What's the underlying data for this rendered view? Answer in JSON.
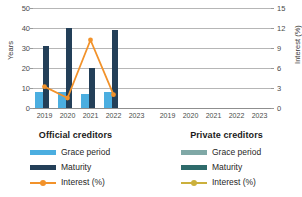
{
  "chart_data": {
    "type": "bar",
    "title": "",
    "subtitle": "",
    "categories": [
      "2019",
      "2020",
      "2021",
      "2022",
      "2023"
    ],
    "xlabel": "",
    "ylabel": "Years",
    "ylabel_secondary": "Interest (%)",
    "ylim": [
      0,
      50
    ],
    "ylim_secondary": [
      0,
      15
    ],
    "yticks": [
      "0",
      "10",
      "20",
      "30",
      "40",
      "50"
    ],
    "yticks_secondary": [
      "0",
      "3",
      "6",
      "9",
      "12",
      "15"
    ],
    "grid": true,
    "legend_position": "bottom",
    "panels": [
      {
        "name": "official",
        "title": "Official creditors",
        "series": [
          {
            "name": "Grace period",
            "type": "bar",
            "axis": "left",
            "color": "#4BAEE0",
            "values": [
              8,
              8,
              7,
              8,
              null
            ]
          },
          {
            "name": "Maturity",
            "type": "bar",
            "axis": "left",
            "color": "#233F58",
            "values": [
              31,
              40,
              20,
              39,
              null
            ]
          },
          {
            "name": "Interest (%)",
            "type": "line",
            "axis": "right",
            "color": "#F2922A",
            "values": [
              3.2,
              1.5,
              10.2,
              2.0,
              null
            ]
          }
        ]
      },
      {
        "name": "private",
        "title": "Private creditors",
        "series": [
          {
            "name": "Grace period",
            "type": "bar",
            "axis": "left",
            "color": "#7FA8A6",
            "values": [
              null,
              null,
              null,
              null,
              null
            ]
          },
          {
            "name": "Maturity",
            "type": "bar",
            "axis": "left",
            "color": "#2E6B6B",
            "values": [
              null,
              null,
              null,
              null,
              null
            ]
          },
          {
            "name": "Interest (%)",
            "type": "line",
            "axis": "right",
            "color": "#CBB03C",
            "values": [
              null,
              null,
              null,
              null,
              null
            ]
          }
        ]
      }
    ]
  },
  "axes": {
    "left_title": "Years",
    "right_title": "Interest (%)",
    "left_ticks": [
      "50",
      "40",
      "30",
      "20",
      "10",
      "0"
    ],
    "right_ticks": [
      "15",
      "12",
      "9",
      "6",
      "3",
      "0"
    ]
  },
  "xaxis": {
    "official": [
      "2019",
      "2020",
      "2021",
      "2022",
      "2023"
    ],
    "private": [
      "2019",
      "2020",
      "2021",
      "2022",
      "2023"
    ]
  },
  "legends": {
    "official": {
      "title": "Official creditors",
      "items": [
        {
          "label": "Grace period",
          "color": "#4BAEE0",
          "kind": "bar"
        },
        {
          "label": "Maturity",
          "color": "#233F58",
          "kind": "bar"
        },
        {
          "label": "Interest (%)",
          "color": "#F2922A",
          "kind": "line"
        }
      ]
    },
    "private": {
      "title": "Private creditors",
      "items": [
        {
          "label": "Grace period",
          "color": "#7FA8A6",
          "kind": "bar"
        },
        {
          "label": "Maturity",
          "color": "#2E6B6B",
          "kind": "bar"
        },
        {
          "label": "Interest (%)",
          "color": "#CBB03C",
          "kind": "line"
        }
      ]
    }
  }
}
